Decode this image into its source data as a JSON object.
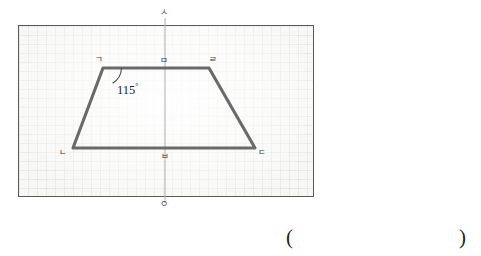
{
  "figure": {
    "type": "line-symmetric-trapezoid",
    "axis_top_label": "ㅅ",
    "axis_bottom_label": "ㅇ",
    "angle_label": "115",
    "angle_degree_symbol": "°",
    "vertices": [
      {
        "name": "top-left",
        "label": "ㄱ"
      },
      {
        "name": "top-mid",
        "label": "ㅁ"
      },
      {
        "name": "top-right",
        "label": "ㄹ"
      },
      {
        "name": "bottom-left",
        "label": "ㄴ"
      },
      {
        "name": "bottom-mid",
        "label": "ㅂ"
      },
      {
        "name": "bottom-right",
        "label": "ㄷ"
      }
    ],
    "colors": {
      "shape_stroke": "#6a6a6a",
      "axis_stroke": "#b4b4b4",
      "frame_border": "#5a5a5a",
      "panel_background": "#f7f7f5",
      "grid_line": "#cdcdc8",
      "text": "#1d1d1d"
    }
  },
  "answer": {
    "open_paren": "(",
    "close_paren": ")",
    "value": ""
  }
}
